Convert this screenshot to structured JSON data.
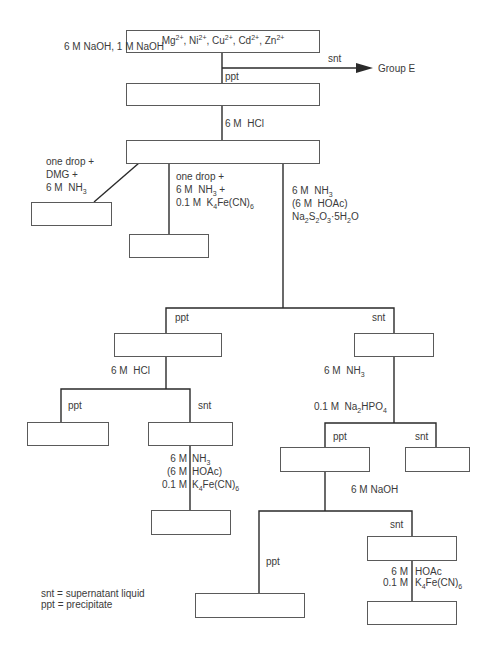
{
  "start": {
    "ions": [
      {
        "symbol": "Mg",
        "charge": "2+"
      },
      {
        "symbol": "Ni",
        "charge": "2+"
      },
      {
        "symbol": "Cu",
        "charge": "2+"
      },
      {
        "symbol": "Cd",
        "charge": "2+"
      },
      {
        "symbol": "Zn",
        "charge": "2+"
      }
    ],
    "separator": ", "
  },
  "step1": {
    "reagent": "6 M NaOH, 1 M NaOH",
    "ppt_label": "ppt",
    "snt_label": "snt",
    "snt_destination": "Group E"
  },
  "step2": {
    "reagent_c": "6 M",
    "reagent_s": "HCl"
  },
  "branch_left": {
    "lines": [
      "one drop +",
      "DMG +",
      "6 M NH3"
    ]
  },
  "branch_middle": {
    "lines": [
      "one drop +",
      "6 M NH3 +",
      "0.1 M K4Fe(CN)6"
    ]
  },
  "branch_right": {
    "lines": [
      "6 M NH3",
      "(6 M HOAc)",
      "Na2S2O3·5H2O"
    ]
  },
  "split2": {
    "ppt_label": "ppt",
    "snt_label": "snt"
  },
  "left_sub": {
    "reagent": "6 M HCl",
    "ppt_label": "ppt",
    "snt_label": "snt",
    "snt_reagents": [
      {
        "c": "6 M",
        "s": "NH3"
      },
      {
        "c": "(6 M",
        "s": "HOAc)"
      },
      {
        "c": "0.1 M",
        "s": "K4Fe(CN)6"
      }
    ]
  },
  "right_sub": {
    "reagent1": "6 M NH3",
    "reagent2": "0.1 M Na2HPO4",
    "ppt_label": "ppt",
    "snt_label": "snt",
    "ppt_reagent": "6 M NaOH",
    "final_ppt_label": "ppt",
    "final_snt_label": "snt",
    "final_snt_reagents": [
      {
        "c": "6 M",
        "s": "HOAc"
      },
      {
        "c": "0.1 M",
        "s": "K4Fe(CN)6"
      }
    ]
  },
  "legend": {
    "snt": "snt = supernatant liquid",
    "ppt": "ppt = precipitate"
  }
}
